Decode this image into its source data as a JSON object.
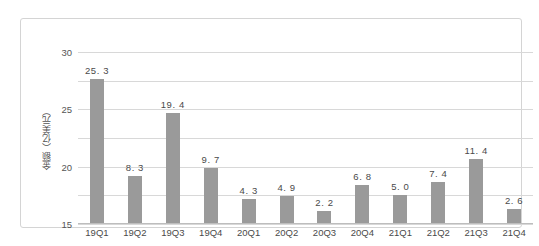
{
  "chart_data": {
    "type": "bar",
    "title": "",
    "xlabel": "",
    "ylabel": "金额（亿美元）",
    "ylim": [
      0,
      30
    ],
    "yticks": [
      "30",
      "25",
      "20",
      "15",
      "10",
      "5",
      "0"
    ],
    "grid": true,
    "legend": "none",
    "bar_color": "#9a9a9a",
    "categories": [
      "19Q1",
      "19Q2",
      "19Q3",
      "19Q4",
      "20Q1",
      "20Q2",
      "20Q3",
      "20Q4",
      "21Q1",
      "21Q2",
      "21Q3",
      "21Q4"
    ],
    "values": [
      25.3,
      8.3,
      19.4,
      9.7,
      4.3,
      4.9,
      2.2,
      6.8,
      5.0,
      7.4,
      11.4,
      2.6
    ],
    "data_labels": [
      "25. 3",
      "8. 3",
      "19. 4",
      "9. 7",
      "4. 3",
      "4. 9",
      "2. 2",
      "6. 8",
      "5. 0",
      "7. 4",
      "11. 4",
      "2. 6"
    ]
  }
}
